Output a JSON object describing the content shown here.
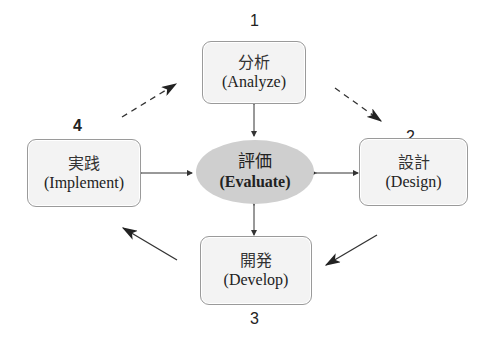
{
  "diagram": {
    "center": {
      "jp": "評価",
      "en": "(Evaluate)"
    },
    "nodes": [
      {
        "number": "1",
        "jp": "分析",
        "en": "(Analyze)"
      },
      {
        "number": "2",
        "jp": "設計",
        "en": "(Design)"
      },
      {
        "number": "3",
        "jp": "開発",
        "en": "(Develop)"
      },
      {
        "number": "4",
        "jp": "実践",
        "en": "(Implement)"
      }
    ],
    "colors": {
      "box_fill": "#f3f3f3",
      "box_border": "#9a9a9a",
      "center_fill": "#cfcfcf",
      "arrow": "#222222"
    }
  }
}
